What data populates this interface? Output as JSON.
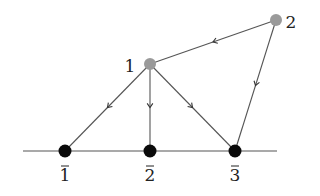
{
  "diagram": {
    "type": "directed-graph",
    "colors": {
      "upper_node": "#9a9a9a",
      "lower_node": "#0a0a0a",
      "edge": "#555555",
      "label": "#222222",
      "background": "#ffffff"
    },
    "baseline": {
      "x1": 23,
      "x2": 277,
      "y": 151
    },
    "nodes": [
      {
        "id": "1",
        "label": "1",
        "x": 150,
        "y": 64,
        "kind": "upper",
        "label_x": 130,
        "label_y": 72
      },
      {
        "id": "2",
        "label": "2",
        "x": 276,
        "y": 20,
        "kind": "upper",
        "label_x": 291,
        "label_y": 28
      },
      {
        "id": "1bar",
        "label": "1",
        "bar": true,
        "x": 65,
        "y": 151,
        "kind": "lower",
        "label_x": 65,
        "label_y": 181
      },
      {
        "id": "2bar",
        "label": "2",
        "bar": true,
        "x": 150,
        "y": 151,
        "kind": "lower",
        "label_x": 150,
        "label_y": 181
      },
      {
        "id": "3bar",
        "label": "3",
        "bar": true,
        "x": 235,
        "y": 151,
        "kind": "lower",
        "label_x": 235,
        "label_y": 181
      }
    ],
    "edges": [
      {
        "from": "2",
        "to": "1"
      },
      {
        "from": "2",
        "to": "3bar"
      },
      {
        "from": "1",
        "to": "1bar"
      },
      {
        "from": "1",
        "to": "2bar"
      },
      {
        "from": "1",
        "to": "3bar"
      }
    ]
  }
}
